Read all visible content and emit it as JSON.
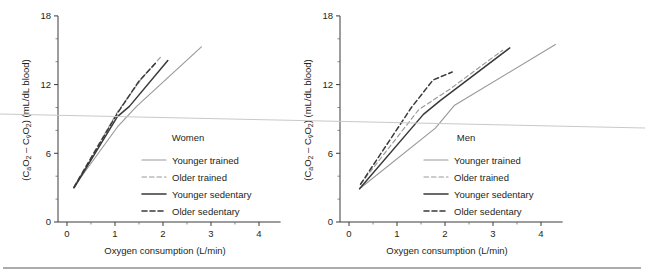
{
  "figure": {
    "background_color": "#ffffff",
    "ink_color": "#231f20",
    "series_gray": "#9a9a9a",
    "series_black": "#3a3a3a",
    "artifact_color": "#c9c9c9"
  },
  "axis": {
    "x_title": "Oxygen consumption (L/min)",
    "y_title_parts": {
      "open": "(C",
      "sub_a": "a",
      "o_one": "O",
      "sub_2a": "2",
      "dash": " – C",
      "sub_v": "v̄",
      "o_two": "O",
      "sub_2b": "2",
      "close": ") (mL/dL blood)"
    },
    "y_title_plain": "(CaO2 – CvO2) (mL/dL blood)",
    "x_ticks": [
      "0",
      "1",
      "2",
      "3",
      "4"
    ],
    "x_tick_values": [
      0,
      1,
      2,
      3,
      4
    ],
    "y_ticks": [
      "0",
      "6",
      "12",
      "18"
    ],
    "y_tick_values": [
      0,
      6,
      12,
      18
    ],
    "x_minor_values": [
      0.5,
      1.5,
      2.5,
      3.5
    ],
    "y_minor_values": [
      2,
      4,
      8,
      10,
      14,
      16
    ],
    "xlim": [
      0,
      4.45
    ],
    "ylim": [
      0,
      18
    ]
  },
  "legend": {
    "entries": [
      {
        "label": "Younger trained",
        "style": "solid",
        "color": "#9a9a9a",
        "width": 1.2
      },
      {
        "label": "Older trained",
        "style": "dashed",
        "color": "#9a9a9a",
        "width": 1.2
      },
      {
        "label": "Younger sedentary",
        "style": "solid",
        "color": "#3a3a3a",
        "width": 1.6
      },
      {
        "label": "Older sedentary",
        "style": "dashed",
        "color": "#3a3a3a",
        "width": 1.6
      }
    ]
  },
  "panels": [
    {
      "id": "women",
      "title": "Women",
      "x_title": "Oxygen consumption (L/min)",
      "y_title_plain": "(CaO2 – CvO2) (mL/dL blood)"
    },
    {
      "id": "men",
      "title": "Men",
      "x_title": "Oxygen consumption (L/min)",
      "y_title_plain": "(CaO2 – CvO2) (mL/dL blood)"
    }
  ],
  "chart_data": {
    "type": "line",
    "xlabel": "Oxygen consumption (L/min)",
    "ylabel": "(CaO2 – CvO2) (mL/dL blood)",
    "xlim": [
      0,
      4.45
    ],
    "ylim": [
      0,
      18
    ],
    "grid": false,
    "legend_position": "inside-lower-right",
    "panels": [
      {
        "name": "Women",
        "series": [
          {
            "name": "Younger trained",
            "style": "solid",
            "color": "#9a9a9a",
            "x": [
              0.15,
              1.05,
              1.45,
              2.8
            ],
            "y": [
              3.1,
              8.3,
              10.1,
              15.3
            ]
          },
          {
            "name": "Older trained",
            "style": "dashed",
            "color": "#9a9a9a",
            "x": [
              0.16,
              1.05,
              1.55,
              1.95
            ],
            "y": [
              3.2,
              9.6,
              12.5,
              14.4
            ]
          },
          {
            "name": "Younger sedentary",
            "style": "solid",
            "color": "#3a3a3a",
            "x": [
              0.15,
              1.05,
              1.3,
              2.1
            ],
            "y": [
              3.0,
              9.2,
              10.1,
              14.1
            ]
          },
          {
            "name": "Older sedentary",
            "style": "dashed",
            "color": "#3a3a3a",
            "x": [
              0.14,
              1.05,
              1.5,
              1.85
            ],
            "y": [
              3.0,
              9.5,
              12.3,
              13.9
            ]
          }
        ]
      },
      {
        "name": "Men",
        "series": [
          {
            "name": "Younger trained",
            "style": "solid",
            "color": "#9a9a9a",
            "x": [
              0.22,
              1.8,
              2.2,
              4.3
            ],
            "y": [
              2.9,
              8.2,
              10.2,
              15.5
            ]
          },
          {
            "name": "Older trained",
            "style": "dashed",
            "color": "#9a9a9a",
            "x": [
              0.24,
              1.45,
              2.1,
              3.2
            ],
            "y": [
              3.3,
              9.8,
              11.6,
              15.0
            ]
          },
          {
            "name": "Younger sedentary",
            "style": "solid",
            "color": "#3a3a3a",
            "x": [
              0.22,
              1.55,
              1.9,
              3.35
            ],
            "y": [
              2.9,
              9.4,
              10.6,
              15.2
            ]
          },
          {
            "name": "Older sedentary",
            "style": "dashed",
            "color": "#3a3a3a",
            "x": [
              0.24,
              1.3,
              1.75,
              2.15
            ],
            "y": [
              3.3,
              10.0,
              12.4,
              13.1
            ]
          }
        ]
      }
    ]
  }
}
